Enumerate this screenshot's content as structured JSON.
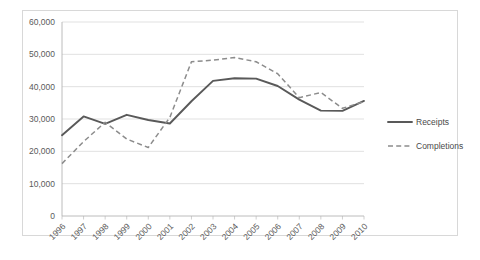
{
  "chart_data": {
    "type": "line",
    "title": "",
    "xlabel": "",
    "ylabel": "",
    "ylim": [
      0,
      60000
    ],
    "ytick_labels": [
      "0",
      "10,000",
      "20,000",
      "30,000",
      "40,000",
      "50,000",
      "60,000"
    ],
    "ytick_values": [
      0,
      10000,
      20000,
      30000,
      40000,
      50000,
      60000
    ],
    "grid": true,
    "legend_position": "right",
    "categories": [
      "1996",
      "1997",
      "1998",
      "1999",
      "2000",
      "2001",
      "2002",
      "2003",
      "2004",
      "2005",
      "2006",
      "2007",
      "2008",
      "2009",
      "2010"
    ],
    "x": [
      1996,
      1997,
      1998,
      1999,
      2000,
      2001,
      2002,
      2003,
      2004,
      2005,
      2006,
      2007,
      2008,
      2009,
      2010
    ],
    "series": [
      {
        "name": "Receipts",
        "style": "solid",
        "color": "#595959",
        "values": [
          25000,
          30800,
          28500,
          31300,
          29700,
          28600,
          35500,
          41800,
          42600,
          42500,
          40200,
          36000,
          32600,
          32500,
          35600
        ]
      },
      {
        "name": "Completions",
        "style": "dashed",
        "color": "#8c8c8c",
        "values": [
          16200,
          23000,
          29000,
          23800,
          21200,
          30500,
          47700,
          48200,
          49000,
          47700,
          44000,
          36600,
          38200,
          33300,
          35400
        ]
      }
    ]
  },
  "legend": {
    "items": [
      {
        "label": "Receipts",
        "style": "solid"
      },
      {
        "label": "Completions",
        "style": "dashed"
      }
    ]
  }
}
